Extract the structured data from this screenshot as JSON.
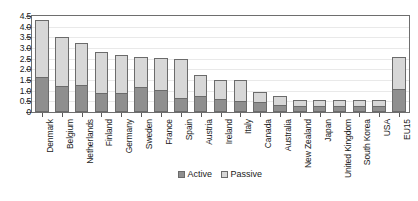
{
  "chart_data": {
    "type": "bar",
    "barmode": "stacked",
    "title": "",
    "xlabel": "",
    "ylabel": "",
    "ylim": [
      0,
      4.5
    ],
    "ytick_values": [
      0,
      0.5,
      1.0,
      1.5,
      2.0,
      2.5,
      3.0,
      3.5,
      4.0,
      4.5
    ],
    "ytick_labels": [
      "0",
      "0.5",
      "1.0",
      "1.5",
      "2.0",
      "2.5",
      "3.0",
      "3.5",
      "4.0",
      "4.5"
    ],
    "grid": false,
    "legend_position": "bottom-center",
    "categories": [
      "Denmark",
      "Belgium",
      "Netherlands",
      "Finland",
      "Germany",
      "Sweden",
      "France",
      "Spain",
      "Austria",
      "Ireland",
      "Italy",
      "Canada",
      "Australia",
      "New Zealand",
      "Japan",
      "United Kingdom",
      "South Korea",
      "USA",
      "EU15"
    ],
    "series": [
      {
        "name": "Active",
        "color": "#8f8f8f",
        "values": [
          1.65,
          1.22,
          1.28,
          0.9,
          0.9,
          1.15,
          1.03,
          0.65,
          0.75,
          0.6,
          0.5,
          0.45,
          0.35,
          0.3,
          0.3,
          0.3,
          0.3,
          0.3,
          1.1
        ]
      },
      {
        "name": "Passive",
        "color": "#d7d7d7",
        "values": [
          2.65,
          2.28,
          1.95,
          1.9,
          1.75,
          1.45,
          1.5,
          1.85,
          1.0,
          0.9,
          1.0,
          0.5,
          0.4,
          0.25,
          0.25,
          0.25,
          0.25,
          0.25,
          1.5
        ]
      }
    ],
    "totals": [
      4.3,
      3.5,
      3.23,
      2.8,
      2.65,
      2.6,
      2.53,
      2.5,
      1.75,
      1.5,
      1.5,
      0.95,
      0.75,
      0.55,
      0.55,
      0.55,
      0.55,
      0.55,
      2.6
    ]
  },
  "legend": {
    "items": [
      {
        "label": "Active"
      },
      {
        "label": "Passive"
      }
    ]
  }
}
